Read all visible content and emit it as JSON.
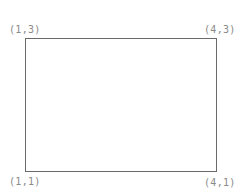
{
  "diagram": {
    "shape": "rectangle",
    "corners": {
      "top_left": "(1,3)",
      "top_right": "(4,3)",
      "bottom_left": "(1,1)",
      "bottom_right": "(4,1)"
    },
    "colors": {
      "stroke": "#6a6a6a",
      "label": "#8a8a8a",
      "background": "#ffffff"
    }
  }
}
